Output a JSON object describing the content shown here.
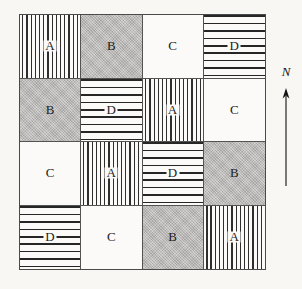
{
  "figure": {
    "name": "latin-square-field-plot-layout",
    "background_color": "#f8f7f4",
    "border_color": "#4a4a4a"
  },
  "orientation": {
    "label": "N",
    "arrow_icon": "north-arrow-icon",
    "direction": "up"
  },
  "legend": {
    "treatments": [
      {
        "code": "A",
        "pattern": "vertical-stripes"
      },
      {
        "code": "B",
        "pattern": "solid-gray",
        "color": "#b9b8b6"
      },
      {
        "code": "C",
        "pattern": "blank",
        "color": "#fbfaf8"
      },
      {
        "code": "D",
        "pattern": "brick-dashes"
      }
    ]
  },
  "grid": {
    "rows": 4,
    "columns": 4,
    "cells": [
      {
        "row": 1,
        "col": 1,
        "label": "A",
        "pattern": "vertical-stripes"
      },
      {
        "row": 1,
        "col": 2,
        "label": "B",
        "pattern": "solid-gray"
      },
      {
        "row": 1,
        "col": 3,
        "label": "C",
        "pattern": "blank"
      },
      {
        "row": 1,
        "col": 4,
        "label": "D",
        "pattern": "brick-dashes"
      },
      {
        "row": 2,
        "col": 1,
        "label": "B",
        "pattern": "solid-gray"
      },
      {
        "row": 2,
        "col": 2,
        "label": "D",
        "pattern": "brick-dashes"
      },
      {
        "row": 2,
        "col": 3,
        "label": "A",
        "pattern": "vertical-stripes"
      },
      {
        "row": 2,
        "col": 4,
        "label": "C",
        "pattern": "blank"
      },
      {
        "row": 3,
        "col": 1,
        "label": "C",
        "pattern": "blank"
      },
      {
        "row": 3,
        "col": 2,
        "label": "A",
        "pattern": "vertical-stripes"
      },
      {
        "row": 3,
        "col": 3,
        "label": "D",
        "pattern": "brick-dashes"
      },
      {
        "row": 3,
        "col": 4,
        "label": "B",
        "pattern": "solid-gray"
      },
      {
        "row": 4,
        "col": 1,
        "label": "D",
        "pattern": "brick-dashes"
      },
      {
        "row": 4,
        "col": 2,
        "label": "C",
        "pattern": "blank"
      },
      {
        "row": 4,
        "col": 3,
        "label": "B",
        "pattern": "solid-gray"
      },
      {
        "row": 4,
        "col": 4,
        "label": "A",
        "pattern": "vertical-stripes"
      }
    ]
  }
}
